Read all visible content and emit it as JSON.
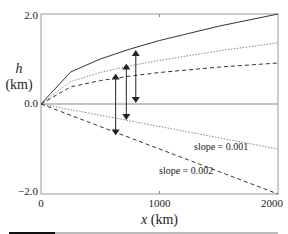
{
  "chart_data": {
    "type": "line",
    "title": "",
    "xlabel": "x (km)",
    "ylabel_var": "h",
    "ylabel_unit": "(km)",
    "xlim": [
      0,
      2000
    ],
    "ylim": [
      -2.0,
      2.0
    ],
    "xticks": [
      "0",
      "1000",
      "2000"
    ],
    "yticks": [
      "2.0",
      "0.0",
      "−2.0"
    ],
    "grid": false,
    "series": [
      {
        "name": "upper solid",
        "style": "solid",
        "x": [
          0,
          250,
          500,
          750,
          1000,
          1500,
          2000
        ],
        "values": [
          0,
          0.71,
          1.0,
          1.22,
          1.41,
          1.73,
          2.0
        ]
      },
      {
        "name": "upper dotted",
        "style": "dotted",
        "x": [
          0,
          250,
          500,
          750,
          1000,
          1500,
          2000
        ],
        "values": [
          0,
          0.5,
          0.7,
          0.85,
          0.97,
          1.18,
          1.36
        ]
      },
      {
        "name": "upper dashed",
        "style": "dashed",
        "x": [
          0,
          250,
          500,
          750,
          1000,
          1500,
          2000
        ],
        "values": [
          0,
          0.38,
          0.52,
          0.62,
          0.7,
          0.82,
          0.91
        ]
      },
      {
        "name": "slope = 0.001",
        "style": "dotted",
        "x": [
          0,
          2000
        ],
        "values": [
          0,
          -1.0
        ]
      },
      {
        "name": "slope = 0.002",
        "style": "dashed",
        "x": [
          0,
          2000
        ],
        "values": [
          0,
          -2.0
        ]
      }
    ],
    "annotations": [
      "slope = 0.001",
      "slope = 0.002"
    ],
    "arrows": [
      {
        "x": 630,
        "from": 0.7,
        "to": -0.72,
        "style": "double-headed"
      },
      {
        "x": 720,
        "from": 0.92,
        "to": -0.38,
        "style": "double-headed"
      },
      {
        "x": 800,
        "from": 1.22,
        "to": 0.0,
        "style": "double-headed"
      }
    ]
  }
}
